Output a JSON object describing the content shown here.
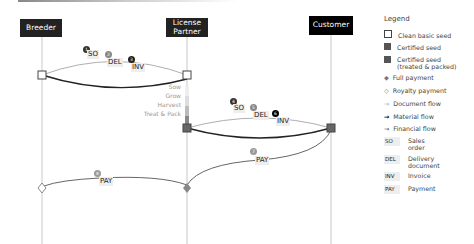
{
  "actors": [
    {
      "name": "Breeder"
    },
    {
      "name": "License Partner"
    },
    {
      "name": "Customer"
    }
  ],
  "flows": {
    "breeder_partner_docs": [
      {
        "step": "1",
        "label": "SO"
      },
      {
        "step": "2",
        "label": "DEL"
      },
      {
        "step": "3",
        "label": "INV"
      }
    ],
    "partner_customer_docs": [
      {
        "step": "4",
        "label": "SO"
      },
      {
        "step": "5",
        "label": "DEL"
      },
      {
        "step": "6",
        "label": "INV"
      }
    ],
    "payments": [
      {
        "step": "7",
        "label": "PAY"
      },
      {
        "step": "8",
        "label": "PAY"
      }
    ],
    "phases": [
      "Sow",
      "Grow",
      "Harvest",
      "Treat & Pack"
    ]
  },
  "legend": {
    "title": "Legend",
    "items": [
      {
        "icon": "clean-basic-seed-icon",
        "label": "Clean basic seed"
      },
      {
        "icon": "certified-seed-icon",
        "label": "Certified seed"
      },
      {
        "icon": "certified-seed-treated-icon",
        "label": "Certified seed (treated & packed)"
      },
      {
        "icon": "full-payment-icon",
        "label": "Full payment"
      },
      {
        "icon": "royalty-payment-icon",
        "label": "Royalty payment"
      },
      {
        "icon": "document-flow-icon",
        "label": "Document flow"
      },
      {
        "icon": "material-flow-icon",
        "label": "Material flow"
      },
      {
        "icon": "financial-flow-icon",
        "label": "Financial flow"
      }
    ],
    "abbreviations": [
      {
        "code": "SO",
        "label": "Sales order"
      },
      {
        "code": "DEL",
        "label": "Delivery document"
      },
      {
        "code": "INV",
        "label": "Invoice"
      },
      {
        "code": "PAY",
        "label": "Payment"
      }
    ]
  }
}
